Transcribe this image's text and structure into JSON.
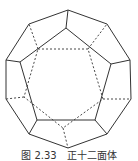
{
  "figure": {
    "stroke_color": "#333333",
    "visible_edges": {
      "outer_decagon": [
        [
          68,
          10
        ],
        [
          107,
          24
        ],
        [
          130,
          60
        ],
        [
          131,
          99
        ],
        [
          107,
          134
        ],
        [
          68,
          148
        ],
        [
          29,
          134
        ],
        [
          6,
          99
        ],
        [
          6,
          60
        ],
        [
          29,
          24
        ]
      ],
      "front_pentagon": [
        [
          66,
          28
        ],
        [
          111,
          64
        ],
        [
          95,
          120
        ],
        [
          37,
          120
        ],
        [
          20,
          62
        ]
      ],
      "spokes": [
        [
          [
            68,
            10
          ],
          [
            66,
            28
          ]
        ],
        [
          [
            130,
            60
          ],
          [
            111,
            64
          ]
        ],
        [
          [
            107,
            134
          ],
          [
            95,
            120
          ]
        ],
        [
          [
            29,
            134
          ],
          [
            37,
            120
          ]
        ],
        [
          [
            6,
            60
          ],
          [
            20,
            62
          ]
        ]
      ]
    },
    "hidden_edges": {
      "back_pentagon": [
        [
          38,
          49
        ],
        [
          88,
          49
        ],
        [
          103,
          99
        ],
        [
          63,
          128
        ],
        [
          24,
          97
        ]
      ],
      "spokes": [
        [
          [
            38,
            49
          ],
          [
            29,
            24
          ]
        ],
        [
          [
            88,
            49
          ],
          [
            107,
            24
          ]
        ],
        [
          [
            103,
            99
          ],
          [
            131,
            99
          ]
        ],
        [
          [
            63,
            128
          ],
          [
            68,
            148
          ]
        ],
        [
          [
            24,
            97
          ],
          [
            6,
            99
          ]
        ]
      ]
    }
  },
  "caption": "图 2.33　正十二面体"
}
